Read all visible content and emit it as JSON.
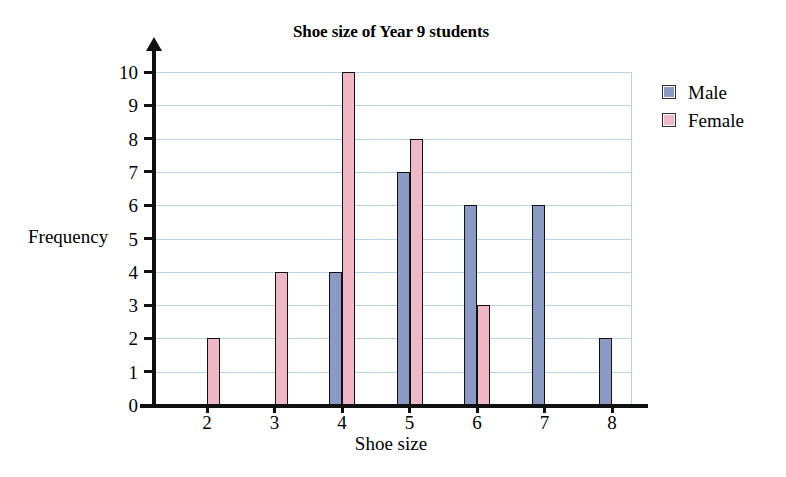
{
  "chart_data": {
    "type": "bar",
    "title": "Shoe size of Year 9 students",
    "xlabel": "Shoe size",
    "ylabel": "Frequency",
    "categories": [
      "2",
      "3",
      "4",
      "5",
      "6",
      "7",
      "8"
    ],
    "series": [
      {
        "name": "Male",
        "color": "#8a9ac4",
        "values": [
          0,
          0,
          4,
          7,
          6,
          6,
          2
        ]
      },
      {
        "name": "Female",
        "color": "#f0b8c4",
        "values": [
          2,
          4,
          10,
          8,
          3,
          0,
          0
        ]
      }
    ],
    "ylim": [
      0,
      10
    ],
    "ytick_labels": [
      "0",
      "1",
      "2",
      "3",
      "4",
      "5",
      "6",
      "7",
      "8",
      "9",
      "10"
    ],
    "grid": true,
    "grid_color": "#b8d4e8",
    "legend_position": "right",
    "legend": [
      {
        "label": "Male",
        "swatch": "male-swatch"
      },
      {
        "label": "Female",
        "swatch": "female-swatch"
      }
    ]
  },
  "icons": {
    "y_axis_arrow": "arrow-up-icon"
  }
}
